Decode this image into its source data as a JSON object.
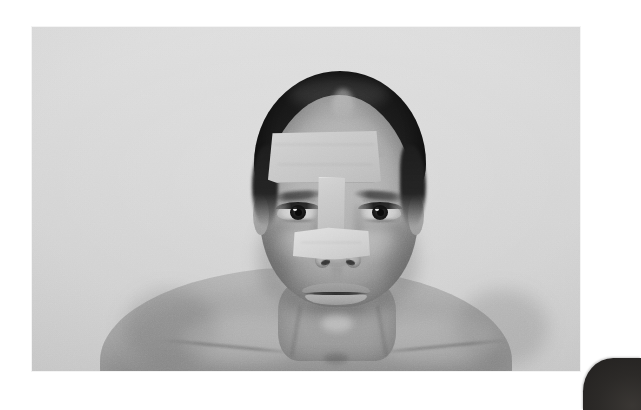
{
  "page": {
    "background_color": "#ffffff"
  },
  "photograph": {
    "name": "clinical-frontal-face-photo",
    "alt_text": "Frontal clinical photograph of a woman with surgical tape on forehead and nose",
    "bounds": {
      "left": 32,
      "top": 27,
      "width": 548,
      "height": 344
    },
    "backdrop_color": "#d4d4d4",
    "tone": "grayscale",
    "orientation": "landscape",
    "subject": {
      "view": "frontal",
      "hair": {
        "color": "#232120",
        "style": "pulled back"
      },
      "skin_tone": "#b4aea8",
      "expression": "neutral",
      "shoulders": "bare"
    },
    "tapes": [
      {
        "id": "tape-forehead",
        "label": "forehead-tape",
        "region": "forehead",
        "color": "#cdc5bb",
        "shape": "large rectangle",
        "bounds": {
          "left": 236,
          "top": 103,
          "width": 113,
          "height": 53
        }
      },
      {
        "id": "tape-bridge",
        "label": "nasal-dorsum-tape",
        "region": "nasal bridge",
        "color": "#c6beb4",
        "shape": "vertical strip",
        "bounds": {
          "left": 285,
          "top": 150,
          "width": 28,
          "height": 56
        }
      },
      {
        "id": "tape-nose",
        "label": "nasal-tip-tape",
        "region": "nasal tip",
        "color": "#d9d2c9",
        "shape": "horizontal strip",
        "bounds": {
          "left": 261,
          "top": 200,
          "width": 77,
          "height": 33
        }
      }
    ]
  },
  "corner_object": {
    "name": "dark-rounded-object",
    "color": "#2c2a28",
    "position": "bottom-right",
    "bounds": {
      "left": 583,
      "top": 358,
      "width": 58,
      "height": 52
    }
  }
}
